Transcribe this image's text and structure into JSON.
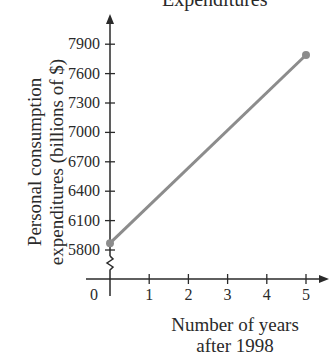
{
  "chart_data": {
    "type": "line",
    "title": "Expenditures",
    "xlabel": "Number of years after 1998",
    "ylabel": "Personal consumption expenditures (billions of $)",
    "x": [
      0,
      5
    ],
    "series": [
      {
        "name": "Personal consumption expenditures",
        "values": [
          5870,
          7790
        ],
        "color": "#8c8c8c"
      }
    ],
    "x_ticks": [
      "0",
      "1",
      "2",
      "3",
      "4",
      "5"
    ],
    "y_ticks": [
      "5800",
      "6100",
      "6400",
      "6700",
      "7000",
      "7300",
      "7600",
      "7900"
    ],
    "xlim": [
      0,
      5
    ],
    "ylim": [
      5800,
      7900
    ],
    "y_axis_break": true,
    "grid": false,
    "legend": "none"
  },
  "labels": {
    "title": "Expenditures",
    "xlabel_line1": "Number of years",
    "xlabel_line2": "after 1998",
    "ylabel_line1": "Personal consumption",
    "ylabel_line2": "expenditures (billions of $)"
  }
}
